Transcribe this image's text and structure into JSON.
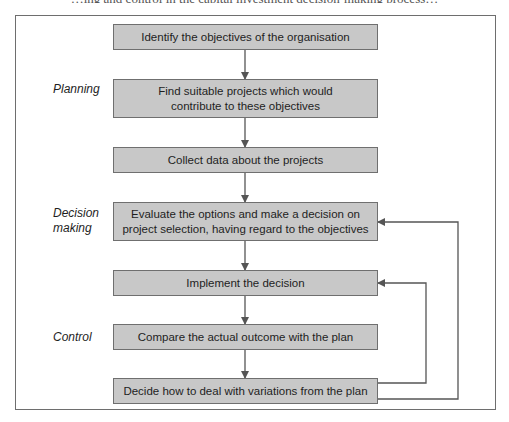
{
  "header": {
    "cutoff_text": "…ing and control in the capital investment decision-making process…"
  },
  "diagram": {
    "stages": [
      {
        "label": "Planning"
      },
      {
        "label": "Decision\nmaking"
      },
      {
        "label": "Control"
      }
    ],
    "steps": [
      {
        "text": "Identify the objectives of the organisation"
      },
      {
        "text": "Find suitable projects which would contribute to these objectives"
      },
      {
        "text": "Collect data about the projects"
      },
      {
        "text": "Evaluate the options and make a decision on project selection, having regard to the objectives"
      },
      {
        "text": "Implement the decision"
      },
      {
        "text": "Compare the actual outcome with the plan"
      },
      {
        "text": "Decide how to deal with variations from the plan"
      }
    ],
    "feedback_loops": [
      {
        "from": "Decide how to deal with variations from the plan",
        "to": "Implement the decision"
      },
      {
        "from": "Decide how to deal with variations from the plan",
        "to": "Evaluate the options and make a decision on project selection, having regard to the objectives"
      }
    ],
    "colors": {
      "box_fill": "#c8c8c8",
      "box_border": "#6f6f6f",
      "line": "#555555",
      "frame": "#6e6e6e"
    }
  }
}
